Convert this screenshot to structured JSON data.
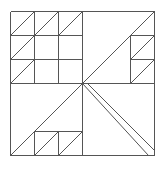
{
  "diagram": {
    "type": "quilt-block-line-drawing",
    "stroke_color": "#555555",
    "background": "#ffffff",
    "outer_square": {
      "x": 10,
      "y": 11,
      "size": 144
    },
    "grid_unit": 24,
    "lines": [
      {
        "x1": 10,
        "y1": 11,
        "x2": 154,
        "y2": 11,
        "kind": "border"
      },
      {
        "x1": 154,
        "y1": 11,
        "x2": 154,
        "y2": 155,
        "kind": "border"
      },
      {
        "x1": 10,
        "y1": 155,
        "x2": 154,
        "y2": 155,
        "kind": "border"
      },
      {
        "x1": 10,
        "y1": 11,
        "x2": 10,
        "y2": 155,
        "kind": "border"
      },
      {
        "x1": 10,
        "y1": 83,
        "x2": 154,
        "y2": 83,
        "kind": "grid"
      },
      {
        "x1": 82,
        "y1": 11,
        "x2": 82,
        "y2": 155,
        "kind": "grid"
      },
      {
        "x1": 10,
        "y1": 35,
        "x2": 82,
        "y2": 35,
        "kind": "grid"
      },
      {
        "x1": 10,
        "y1": 59,
        "x2": 82,
        "y2": 59,
        "kind": "grid"
      },
      {
        "x1": 34,
        "y1": 11,
        "x2": 34,
        "y2": 83,
        "kind": "grid"
      },
      {
        "x1": 58,
        "y1": 11,
        "x2": 58,
        "y2": 83,
        "kind": "grid"
      },
      {
        "x1": 10,
        "y1": 35,
        "x2": 34,
        "y2": 11,
        "kind": "diag"
      },
      {
        "x1": 34,
        "y1": 35,
        "x2": 58,
        "y2": 11,
        "kind": "diag"
      },
      {
        "x1": 58,
        "y1": 35,
        "x2": 82,
        "y2": 11,
        "kind": "diag"
      },
      {
        "x1": 10,
        "y1": 59,
        "x2": 34,
        "y2": 35,
        "kind": "diag"
      },
      {
        "x1": 10,
        "y1": 83,
        "x2": 34,
        "y2": 59,
        "kind": "diag"
      },
      {
        "x1": 82,
        "y1": 83,
        "x2": 154,
        "y2": 11,
        "kind": "diag"
      },
      {
        "x1": 130,
        "y1": 35,
        "x2": 130,
        "y2": 83,
        "kind": "grid"
      },
      {
        "x1": 130,
        "y1": 35,
        "x2": 154,
        "y2": 35,
        "kind": "grid"
      },
      {
        "x1": 130,
        "y1": 59,
        "x2": 154,
        "y2": 59,
        "kind": "grid"
      },
      {
        "x1": 130,
        "y1": 59,
        "x2": 154,
        "y2": 35,
        "kind": "diag"
      },
      {
        "x1": 130,
        "y1": 83,
        "x2": 154,
        "y2": 59,
        "kind": "diag"
      },
      {
        "x1": 10,
        "y1": 155,
        "x2": 82,
        "y2": 83,
        "kind": "diag"
      },
      {
        "x1": 34,
        "y1": 131,
        "x2": 82,
        "y2": 131,
        "kind": "grid"
      },
      {
        "x1": 34,
        "y1": 131,
        "x2": 34,
        "y2": 155,
        "kind": "grid"
      },
      {
        "x1": 58,
        "y1": 131,
        "x2": 58,
        "y2": 155,
        "kind": "grid"
      },
      {
        "x1": 34,
        "y1": 155,
        "x2": 58,
        "y2": 131,
        "kind": "diag"
      },
      {
        "x1": 58,
        "y1": 155,
        "x2": 82,
        "y2": 131,
        "kind": "diag"
      },
      {
        "x1": 82,
        "y1": 83,
        "x2": 148,
        "y2": 155,
        "kind": "diag"
      },
      {
        "x1": 87,
        "y1": 83,
        "x2": 154,
        "y2": 150,
        "kind": "diag"
      }
    ]
  }
}
